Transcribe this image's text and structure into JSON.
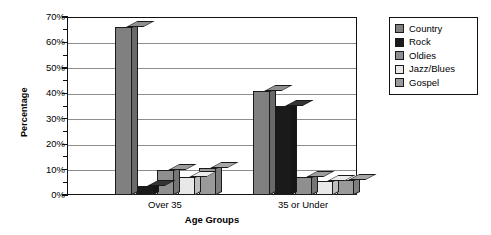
{
  "chart_data": {
    "type": "bar",
    "title": "",
    "xlabel": "Age Groups",
    "ylabel": "Percentage",
    "categories": [
      "Over 35",
      "35 or Under"
    ],
    "series": [
      {
        "name": "Country",
        "values": [
          66,
          41
        ],
        "color": "#808080"
      },
      {
        "name": "Rock",
        "values": [
          3.5,
          35
        ],
        "color": "#1a1a1a"
      },
      {
        "name": "Oldies",
        "values": [
          10,
          7
        ],
        "color": "#8f8f8f"
      },
      {
        "name": "Jazz/Blues",
        "values": [
          7,
          5.5
        ],
        "color": "#e8e8e8"
      },
      {
        "name": "Gospel",
        "values": [
          10.5,
          6
        ],
        "color": "#9a9a9a"
      }
    ],
    "ylim": [
      0,
      70
    ],
    "ytick_labels": [
      "0%",
      "10%",
      "20%",
      "30%",
      "40%",
      "50%",
      "60%",
      "70%"
    ],
    "ytick_values": [
      0,
      10,
      20,
      30,
      40,
      50,
      60,
      70
    ],
    "yminor_values": [
      5,
      15,
      25,
      35,
      45,
      55,
      65
    ],
    "grid": true,
    "legend_position": "right",
    "gridline_color": "#8d8d8d",
    "axis_color": "#111111"
  }
}
